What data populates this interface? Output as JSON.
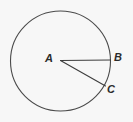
{
  "figure": {
    "kind": "geometry-diagram",
    "background_color": "#f7f7f7",
    "stroke_color": "#4a4a4a",
    "label_color": "#2b2b2b",
    "circle": {
      "name": "circle-A",
      "center_x": 60.5,
      "center_y": 61,
      "radius": 50,
      "stroke_width": 1.1
    },
    "segments": [
      {
        "name": "radius-AB",
        "from_x": 60.5,
        "from_y": 60.5,
        "to_x": 110.5,
        "to_y": 60,
        "stroke_width": 1.1
      },
      {
        "name": "radius-AC",
        "from_x": 60.5,
        "from_y": 60.5,
        "to_x": 105.5,
        "to_y": 86,
        "stroke_width": 1.1
      }
    ],
    "labels": [
      {
        "id": "A",
        "text": "A",
        "x": 45,
        "y": 53
      },
      {
        "id": "B",
        "text": "B",
        "x": 114,
        "y": 52
      },
      {
        "id": "C",
        "text": "C",
        "x": 107,
        "y": 84
      }
    ]
  }
}
